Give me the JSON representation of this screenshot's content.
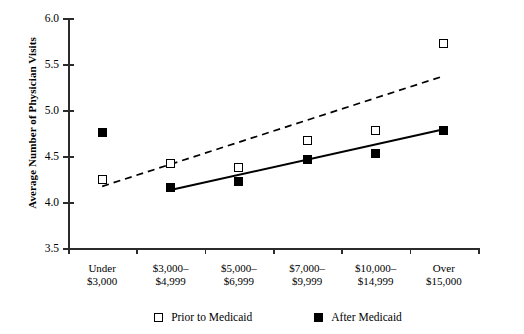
{
  "chart_data": {
    "type": "scatter",
    "title": "",
    "xlabel": "",
    "ylabel": "Average Number of Physician Visits",
    "categories": [
      "Under\n$3,000",
      "$3,000–\n$4,999",
      "$5,000–\n$6,999",
      "$7,000–\n$9,999",
      "$10,000–\n$14,999",
      "Over\n$15,000"
    ],
    "category_lines": [
      [
        "Under",
        "$3,000"
      ],
      [
        "$3,000–",
        "$4,999"
      ],
      [
        "$5,000–",
        "$6,999"
      ],
      [
        "$7,000–",
        "$9,999"
      ],
      [
        "$10,000–",
        "$14,999"
      ],
      [
        "Over",
        "$15,000"
      ]
    ],
    "ylim": [
      3.5,
      6.0
    ],
    "yticks": [
      "3.5",
      "4.0",
      "4.5",
      "5.0",
      "5.5",
      "6.0"
    ],
    "ytick_values": [
      3.5,
      4.0,
      4.5,
      5.0,
      5.5,
      6.0
    ],
    "grid": false,
    "legend_position": "bottom",
    "series": [
      {
        "name": "Prior to Medicaid",
        "marker": "open-square",
        "line_style": "dashed",
        "values": [
          4.25,
          4.42,
          4.37,
          4.67,
          4.78,
          5.72
        ],
        "trend_line": {
          "x_start": 0,
          "y_start": 4.17,
          "x_end": 5,
          "y_end": 5.37
        }
      },
      {
        "name": "After Medicaid",
        "marker": "filled-square",
        "line_style": "solid",
        "values": [
          4.76,
          4.16,
          4.22,
          4.46,
          4.53,
          4.78
        ],
        "trend_line": {
          "x_start": 1,
          "y_start": 4.13,
          "x_end": 5,
          "y_end": 4.79
        }
      }
    ]
  },
  "legend": {
    "entries": [
      {
        "label": "Prior to Medicaid",
        "marker": "open-square"
      },
      {
        "label": "After Medicaid",
        "marker": "filled-square"
      }
    ]
  },
  "axis": {
    "y_title": "Average Number of Physician Visits"
  }
}
